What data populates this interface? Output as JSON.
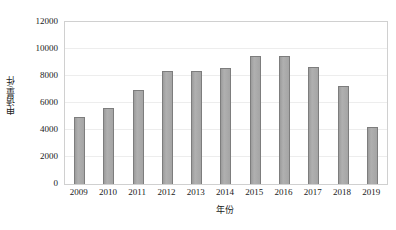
{
  "chart_data": {
    "type": "bar",
    "title": "",
    "subtitle": "",
    "xlabel": "年份",
    "ylabel": "申请量/件",
    "categories": [
      "2009",
      "2010",
      "2011",
      "2012",
      "2013",
      "2014",
      "2015",
      "2016",
      "2017",
      "2018",
      "2019"
    ],
    "values": [
      5000,
      5650,
      6950,
      8380,
      8380,
      8620,
      9500,
      9450,
      8680,
      7250,
      4200
    ],
    "series": [
      {
        "name": "申请量",
        "values": [
          5000,
          5650,
          6950,
          8380,
          8380,
          8620,
          9500,
          9450,
          8680,
          7250,
          4200
        ]
      }
    ],
    "ylim": [
      0,
      12000
    ],
    "ytick_values": [
      0,
      2000,
      4000,
      6000,
      8000,
      10000,
      12000
    ],
    "ytick_labels": [
      "0",
      "2000",
      "4000",
      "6000",
      "8000",
      "10000",
      "12000"
    ],
    "xtick_labels": [
      "2009",
      "2010",
      "2011",
      "2012",
      "2013",
      "2014",
      "2015",
      "2016",
      "2017",
      "2018",
      "2019"
    ],
    "grid": true,
    "grid_axis": "y",
    "legend": false,
    "legend_position": "none",
    "annotations": [],
    "colors": {
      "bar_fill": "#a8a8a8",
      "bar_border": "#7d7d7d",
      "gridline": "#ededed",
      "plot_border": "#d0d0d0",
      "text": "#1a1a1a",
      "background": "#ffffff"
    }
  },
  "axes": {
    "y_title": "申请量/件",
    "x_title": "年份",
    "y_ticks": [
      {
        "label": "12000",
        "value": 12000
      },
      {
        "label": "10000",
        "value": 10000
      },
      {
        "label": "8000",
        "value": 8000
      },
      {
        "label": "6000",
        "value": 6000
      },
      {
        "label": "4000",
        "value": 4000
      },
      {
        "label": "2000",
        "value": 2000
      },
      {
        "label": "0",
        "value": 0
      }
    ],
    "x_ticks": [
      {
        "label": "2009"
      },
      {
        "label": "2010"
      },
      {
        "label": "2011"
      },
      {
        "label": "2012"
      },
      {
        "label": "2013"
      },
      {
        "label": "2014"
      },
      {
        "label": "2015"
      },
      {
        "label": "2016"
      },
      {
        "label": "2017"
      },
      {
        "label": "2018"
      },
      {
        "label": "2019"
      }
    ]
  }
}
